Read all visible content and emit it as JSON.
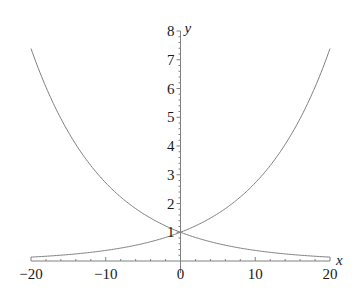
{
  "chart_data": {
    "type": "line",
    "title": "",
    "xlabel": "x",
    "ylabel": "y",
    "xlim": [
      -20,
      20
    ],
    "ylim": [
      0,
      8
    ],
    "grid": false,
    "legend": null,
    "x_ticks": [
      "−20",
      "−10",
      "0",
      "10",
      "20"
    ],
    "x_tick_values": [
      -20,
      -10,
      0,
      10,
      20
    ],
    "y_ticks": [
      "1",
      "2",
      "3",
      "4",
      "5",
      "6",
      "7",
      "8"
    ],
    "y_tick_values": [
      1,
      2,
      3,
      4,
      5,
      6,
      7,
      8
    ],
    "series": [
      {
        "name": "exp(-x/10)",
        "x": [
          -20,
          -15,
          -10,
          -5,
          0,
          5,
          10,
          15,
          20
        ],
        "values": [
          7.39,
          4.48,
          2.72,
          1.65,
          1.0,
          0.61,
          0.37,
          0.22,
          0.14
        ],
        "color": "#808080"
      },
      {
        "name": "exp(x/10)",
        "x": [
          -20,
          -15,
          -10,
          -5,
          0,
          5,
          10,
          15,
          20
        ],
        "values": [
          0.14,
          0.22,
          0.37,
          0.61,
          1.0,
          1.65,
          2.72,
          4.48,
          7.39
        ],
        "color": "#808080"
      }
    ],
    "annotations": []
  },
  "colors": {
    "axis": "#808080",
    "curve": "#808080",
    "text": "#1a1a1a"
  }
}
